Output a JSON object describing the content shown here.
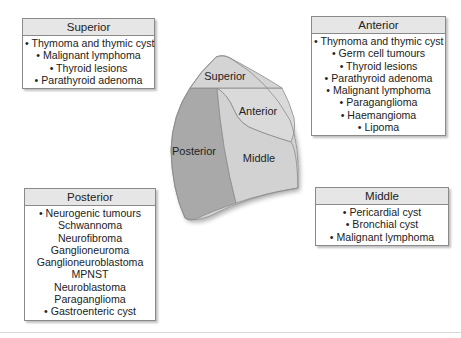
{
  "diagram": {
    "regions": {
      "superior": "Superior",
      "anterior": "Anterior",
      "posterior": "Posterior",
      "middle": "Middle"
    },
    "colors": {
      "superior": "#d2d2d2",
      "anterior": "#d9d9d9",
      "middle": "#d2d2d2",
      "posterior": "#a9a9a9",
      "outline": "#8c8c8c"
    }
  },
  "boxes": {
    "superior": {
      "title": "Superior",
      "items": [
        "• Thymoma and thymic cyst",
        "• Malignant lymphoma",
        "• Thyroid lesions",
        "• Parathyroid adenoma"
      ]
    },
    "anterior": {
      "title": "Anterior",
      "items": [
        "• Thymoma and thymic cyst",
        "• Germ cell tumours",
        "• Thyroid lesions",
        "• Parathyroid adenoma",
        "• Malignant lymphoma",
        "• Paraganglioma",
        "• Haemangioma",
        "• Lipoma"
      ]
    },
    "posterior": {
      "title": "Posterior",
      "items": [
        "• Neurogenic tumours",
        "Schwannoma",
        "Neurofibroma",
        "Ganglioneuroma",
        "Ganglioneuroblastoma",
        "MPNST",
        "Neuroblastoma",
        "Paraganglioma",
        "• Gastroenteric cyst"
      ]
    },
    "middle": {
      "title": "Middle",
      "items": [
        "• Pericardial cyst",
        "• Bronchial cyst",
        "• Malignant lymphoma"
      ]
    }
  }
}
